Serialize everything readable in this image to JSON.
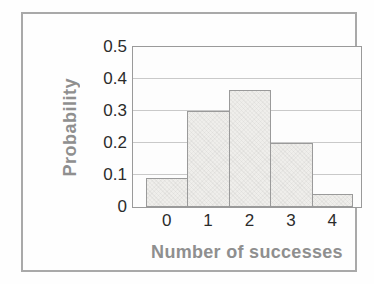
{
  "chart_data": {
    "type": "bar",
    "subtype": "histogram",
    "title": "",
    "xlabel": "Number of successes",
    "ylabel": "Probability",
    "categories": [
      "0",
      "1",
      "2",
      "3",
      "4"
    ],
    "values": [
      0.09,
      0.3,
      0.365,
      0.2,
      0.04
    ],
    "ylim": [
      0,
      0.5
    ],
    "yticks": [
      0,
      0.1,
      0.2,
      0.3,
      0.4,
      0.5
    ],
    "ytick_labels": [
      "0",
      "0.1",
      "0.2",
      "0.3",
      "0.4",
      "0.5"
    ],
    "grid": "horizontal",
    "legend": "none",
    "bars_adjacent": true,
    "colors": {
      "bar_fill": "#efeeeb",
      "bar_border": "#9a9a9a",
      "gridline": "#c9c9c9",
      "plot_frame": "#9a9a9a",
      "outer_border": "#a9a9a9",
      "tick_label": "#2b2b2b",
      "axis_title": "#8f8f8f"
    }
  }
}
